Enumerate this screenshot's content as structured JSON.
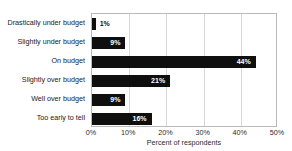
{
  "chart_data": {
    "type": "bar",
    "orientation": "horizontal",
    "title": "",
    "subtitle": "",
    "xlabel": "Percent of respondents",
    "ylabel": "",
    "xlim": [
      0,
      50
    ],
    "xticks": [
      "0%",
      "10%",
      "20%",
      "30%",
      "40%",
      "50%"
    ],
    "xtick_values": [
      0,
      10,
      20,
      30,
      40,
      50
    ],
    "grid": "vertical",
    "legend": "none",
    "bar_color": "#100f0f",
    "categories": [
      "Drastically under budget",
      "Slightly under budget",
      "On budget",
      "Slightly over budget",
      "Well over budget",
      "Too early to tell"
    ],
    "values": [
      1,
      9,
      44,
      21,
      9,
      16
    ],
    "data_labels": [
      "1%",
      "9%",
      "44%",
      "21%",
      "9%",
      "16%"
    ],
    "label_placement": [
      "outside",
      "inside",
      "inside",
      "inside",
      "inside",
      "inside"
    ]
  },
  "colors": {
    "bar": "#100f0f",
    "grid": "#d8d8d8",
    "frame": "#b9b9b9",
    "text": "#1a1a1a",
    "label_inside": "#ffffff",
    "label_outside": "#111111",
    "background": "#ffffff"
  }
}
